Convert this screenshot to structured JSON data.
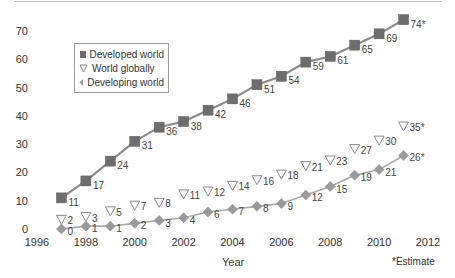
{
  "chart_data": {
    "type": "line",
    "title": "",
    "xlabel": "Year",
    "ylabel": "",
    "footnote": "*Estimate",
    "xlim": [
      1996,
      2012
    ],
    "ylim": [
      0,
      70
    ],
    "x_ticks": [
      "1996",
      "1998",
      "2000",
      "2002",
      "2004",
      "2006",
      "2008",
      "2010",
      "2012"
    ],
    "y_ticks": [
      "0",
      "10",
      "20",
      "30",
      "40",
      "50",
      "60",
      "70"
    ],
    "grid": false,
    "legend_position": "upper-left",
    "x": [
      1997,
      1998,
      1999,
      2000,
      2001,
      2002,
      2003,
      2004,
      2005,
      2006,
      2007,
      2008,
      2009,
      2010,
      2011
    ],
    "series": [
      {
        "name": "Developed world",
        "marker": "square",
        "color": "#6e6e6e",
        "values": [
          11,
          17,
          24,
          31,
          36,
          38,
          42,
          46,
          51,
          54,
          59,
          61,
          65,
          69,
          74
        ],
        "labels": [
          "11",
          "17",
          "24",
          "31",
          "36",
          "38",
          "42",
          "46",
          "51",
          "54",
          "59",
          "61",
          "65",
          "69",
          "74*"
        ]
      },
      {
        "name": "World globally",
        "marker": "triangle-down-open",
        "color": "#8a8a8a",
        "values": [
          2,
          3,
          5,
          7,
          8,
          11,
          12,
          14,
          16,
          18,
          21,
          23,
          27,
          30,
          35
        ],
        "labels": [
          "2",
          "3",
          "5",
          "7",
          "8",
          "11",
          "12",
          "14",
          "16",
          "18",
          "21",
          "23",
          "27",
          "30",
          "35*"
        ]
      },
      {
        "name": "Developing world",
        "marker": "diamond",
        "color": "#9a9a9a",
        "values": [
          0,
          1,
          1,
          2,
          3,
          4,
          6,
          7,
          8,
          9,
          12,
          15,
          19,
          21,
          26
        ],
        "labels": [
          "0",
          "1",
          "1",
          "2",
          "3",
          "4",
          "6",
          "7",
          "8",
          "9",
          "12",
          "15",
          "19",
          "21",
          "26*"
        ]
      }
    ]
  },
  "legend": {
    "items": [
      "Developed world",
      "World globally",
      "Developing world"
    ]
  },
  "axis": {
    "xlabel": "Year",
    "footnote": "*Estimate"
  }
}
